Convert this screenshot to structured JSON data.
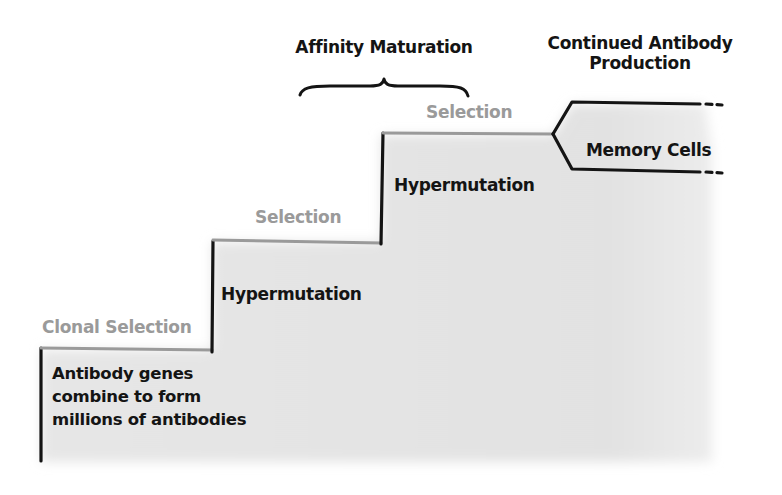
{
  "diagram": {
    "colors": {
      "line_dark": "#141414",
      "line_gray": "#9a9a9a",
      "text_dark": "#141414",
      "text_gray": "#9a9a9a",
      "shade": "#e3e3e3",
      "background": "#ffffff"
    },
    "headings": {
      "affinity_maturation": "Affinity Maturation",
      "continued_production_line1": "Continued Antibody",
      "continued_production_line2": "Production"
    },
    "steps": [
      {
        "name": "clonal-selection",
        "label": "Clonal Selection",
        "description_lines": [
          "Antibody genes",
          "combine to form",
          "millions of antibodies"
        ]
      },
      {
        "name": "hypermutation-selection-1",
        "label": "Selection",
        "description": "Hypermutation"
      },
      {
        "name": "hypermutation-selection-2",
        "label": "Selection",
        "description": "Hypermutation"
      }
    ],
    "outcome": {
      "label": "Memory Cells"
    }
  }
}
